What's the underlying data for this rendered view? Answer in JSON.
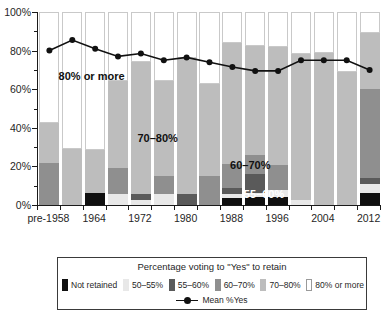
{
  "chart_data": {
    "type": "bar",
    "subtype": "stacked-bar-with-line-overlay",
    "title": "",
    "xlabel": "",
    "ylabel": "",
    "ylim": [
      0,
      100
    ],
    "y_tick_labels": [
      "0%",
      "20%",
      "40%",
      "60%",
      "80%",
      "100%"
    ],
    "y_tick_values": [
      0,
      20,
      40,
      60,
      80,
      100
    ],
    "y_minor_tick_values": [
      10,
      30,
      50,
      70,
      90
    ],
    "grid": false,
    "legend_position": "below-axes",
    "x_tick_labels": [
      "pre-1958",
      "1964",
      "1972",
      "1980",
      "1988",
      "1996",
      "2004",
      "2012"
    ],
    "x_tick_label_indices": [
      0,
      2,
      4,
      6,
      8,
      10,
      12,
      14
    ],
    "categories": [
      "pre-1958",
      "1960",
      "1964",
      "1968",
      "1972",
      "1976",
      "1980",
      "1984",
      "1988",
      "1992",
      "1996",
      "2000",
      "2004",
      "2008",
      "2012"
    ],
    "series": [
      {
        "name": "Not retained",
        "color": "#101010",
        "values": [
          0,
          0,
          6,
          0,
          0,
          0,
          0,
          0,
          3.5,
          4,
          4,
          0,
          0,
          0,
          6
        ]
      },
      {
        "name": "50-55%",
        "color": "#e8e8e8",
        "values": [
          0,
          0,
          0,
          5.5,
          2.5,
          5.5,
          0,
          0,
          2,
          2,
          4,
          2.5,
          0,
          0,
          5
        ]
      },
      {
        "name": "55-60%",
        "color": "#5a5a5a",
        "values": [
          0,
          0,
          0,
          0,
          3,
          0,
          5.5,
          0,
          3.5,
          10,
          0,
          0,
          0,
          0,
          3
        ]
      },
      {
        "name": "60-70%",
        "color": "#8f8f8f",
        "values": [
          22,
          0,
          0,
          13.5,
          0,
          9.5,
          0,
          15,
          12,
          10,
          12.5,
          0,
          0,
          0,
          46
        ]
      },
      {
        "name": "70-80%",
        "color": "#bdbdbd",
        "values": [
          20.5,
          29,
          22.5,
          45.5,
          68.5,
          49.5,
          70.5,
          47.5,
          63,
          56.5,
          61.5,
          75.5,
          79,
          69,
          29
        ]
      },
      {
        "name": "80% or more",
        "color": "#ffffff",
        "values": [
          57.5,
          71,
          71.5,
          35.5,
          26,
          35.5,
          24,
          37.5,
          16,
          17.5,
          18,
          22,
          21,
          31,
          11
        ]
      }
    ],
    "overlay_line": {
      "name": "Mean %Yes",
      "color": "#111111",
      "marker": "circle",
      "values": [
        80,
        85.5,
        81,
        77,
        78.5,
        75,
        76.5,
        74,
        71.5,
        69.5,
        69.5,
        75,
        75,
        75,
        70
      ]
    },
    "plot_annotations": [
      {
        "text": "80% or more",
        "x_pct": 6,
        "y_pct": 70,
        "color": "dark"
      },
      {
        "text": "70–80%",
        "x_pct": 29,
        "y_pct": 38,
        "color": "dark"
      },
      {
        "text": "60–70%",
        "x_pct": 56,
        "y_pct": 24,
        "color": "dark"
      },
      {
        "text": "55–60%",
        "x_pct": 60,
        "y_pct": 9,
        "color": "light"
      }
    ]
  },
  "legend": {
    "title": "Percentage voting to \"Yes\" to retain",
    "items": [
      {
        "label": "Not retained",
        "color": "#101010",
        "outlined": false
      },
      {
        "label": "50–55%",
        "color": "#e8e8e8",
        "outlined": false
      },
      {
        "label": "55–60%",
        "color": "#5a5a5a",
        "outlined": false
      },
      {
        "label": "60–70%",
        "color": "#8f8f8f",
        "outlined": false
      },
      {
        "label": "70–80%",
        "color": "#bdbdbd",
        "outlined": false
      },
      {
        "label": "80% or more",
        "color": "#ffffff",
        "outlined": true
      }
    ],
    "line_entry": {
      "label": "Mean %Yes",
      "color": "#111111"
    }
  }
}
